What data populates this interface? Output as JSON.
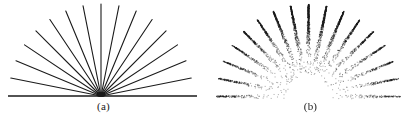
{
  "figure": {
    "background_color": "#ffffff",
    "ink_color": "#1a1a1a",
    "width": 414,
    "height": 124
  },
  "panels": [
    {
      "id": "a",
      "caption": "(a)",
      "style": "clean-vector-line-art",
      "description": "Fan of straight black rays radiating from a hub on a horizontal baseline",
      "hub": {
        "x": 101,
        "y": 96
      },
      "ray_count": 17,
      "ray_angles_deg": [
        0,
        11.25,
        22.5,
        33.75,
        45,
        56.25,
        67.5,
        78.75,
        90,
        101.25,
        112.5,
        123.75,
        135,
        146.25,
        157.5,
        168.75,
        180
      ],
      "ray_length": 92,
      "line_width": 1.1,
      "baseline": {
        "x1": 8,
        "x2": 197,
        "y": 96,
        "width": 1.6
      }
    },
    {
      "id": "b",
      "caption": "(b)",
      "style": "halftone-dithered-degraded",
      "description": "Same fan rendered as stippled wedges, dark at the outer tips and dissolving to sparse dots toward the hub; hub area blank, no baseline",
      "hub": {
        "x": 101,
        "y": 96
      },
      "ray_count": 17,
      "ray_angles_deg": [
        0,
        11.25,
        22.5,
        33.75,
        45,
        56.25,
        67.5,
        78.75,
        90,
        101.25,
        112.5,
        123.75,
        135,
        146.25,
        157.5,
        168.75,
        180
      ],
      "ray_length": 92,
      "hub_void_radius": 22,
      "wedge_tip_half_width": 3.2,
      "dot_size": 1,
      "density_peak": 0.97,
      "density_floor": 0.04,
      "horizontal_ray_fade": 0.35
    }
  ],
  "chart_data": {
    "type": "line",
    "title": "",
    "subtitle": "",
    "xlabel": "",
    "ylabel": "",
    "grid": false,
    "legend": "none",
    "series": [
      {
        "name": "(a) clean rays",
        "angles_deg": [
          0,
          11.25,
          22.5,
          33.75,
          45,
          56.25,
          67.5,
          78.75,
          90,
          101.25,
          112.5,
          123.75,
          135,
          146.25,
          157.5,
          168.75,
          180
        ],
        "radius": 92
      },
      {
        "name": "(b) degraded rays",
        "angles_deg": [
          0,
          11.25,
          22.5,
          33.75,
          45,
          56.25,
          67.5,
          78.75,
          90,
          101.25,
          112.5,
          123.75,
          135,
          146.25,
          157.5,
          168.75,
          180
        ],
        "radius": 92
      }
    ]
  }
}
